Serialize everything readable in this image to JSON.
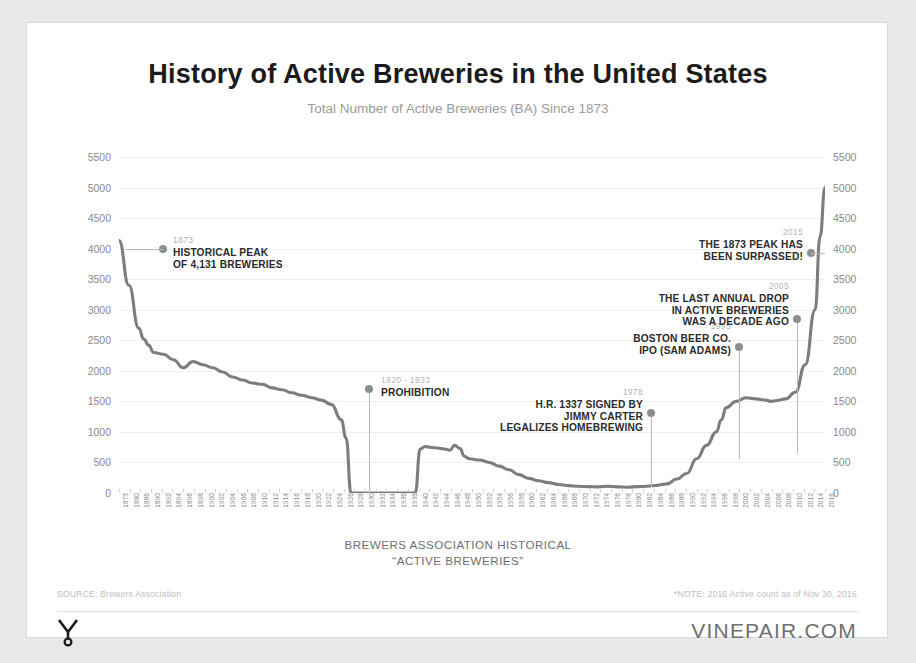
{
  "header": {
    "title": "History of Active Breweries in the United States",
    "subtitle": "Total Number of Active Breweries (BA) Since 1873"
  },
  "footer": {
    "axis_note_line1": "BREWERS ASSOCIATION HISTORICAL",
    "axis_note_line2": "“ACTIVE BREWERIES”",
    "source": "SOURCE: Brewers Association",
    "note": "*NOTE: 2016 Active count as of Nov 30, 2016",
    "logo_text": "VINEPAIR",
    "site": "VINEPAIR.COM"
  },
  "chart_data": {
    "type": "line",
    "title": "History of Active Breweries in the United States",
    "subtitle": "Total Number of Active Breweries (BA) Since 1873",
    "xlabel": "BREWERS ASSOCIATION HISTORICAL “ACTIVE BREWERIES”",
    "ylabel": "",
    "ylim": [
      0,
      5500
    ],
    "ytick_step": 500,
    "yticks": [
      0,
      500,
      1000,
      1500,
      2000,
      2500,
      3000,
      3500,
      4000,
      4500,
      5000,
      5500
    ],
    "ytick_labels": [
      "0",
      "500",
      "1000",
      "1500",
      "2000",
      "2500",
      "3000",
      "3500",
      "4000",
      "4500",
      "5000",
      "5500"
    ],
    "dual_y_axis": true,
    "grid": true,
    "legend": false,
    "line_color": "#7d7d7d",
    "xlim": [
      1873,
      2016
    ],
    "xtick_labels": [
      "1873",
      "1880",
      "1886",
      "1890",
      "1892",
      "1894",
      "1896",
      "1898",
      "1900",
      "1902",
      "1904",
      "1906",
      "1908",
      "1910",
      "1912",
      "1914",
      "1916",
      "1918",
      "1920",
      "1922",
      "1924",
      "1926",
      "1928",
      "1930",
      "1932",
      "1934",
      "1936",
      "1938",
      "1940",
      "1942",
      "1944",
      "1946",
      "1948",
      "1950",
      "1952",
      "1954",
      "1956",
      "1958",
      "1960",
      "1962",
      "1964",
      "1966",
      "1968",
      "1970",
      "1972",
      "1974",
      "1976",
      "1978",
      "1980",
      "1982",
      "1984",
      "1986",
      "1988",
      "1990",
      "1992",
      "1994",
      "1996",
      "1998",
      "2000",
      "2002",
      "2004",
      "2006",
      "2008",
      "2010",
      "2012",
      "2014",
      "2016"
    ],
    "series": [
      {
        "name": "Active Breweries",
        "x": [
          1873,
          1875,
          1877,
          1878,
          1879,
          1880,
          1882,
          1884,
          1886,
          1888,
          1890,
          1892,
          1894,
          1896,
          1898,
          1900,
          1902,
          1904,
          1906,
          1908,
          1910,
          1912,
          1914,
          1916,
          1918,
          1919,
          1920,
          1921,
          1933,
          1934,
          1935,
          1936,
          1937,
          1938,
          1939,
          1940,
          1941,
          1942,
          1943,
          1944,
          1946,
          1948,
          1950,
          1952,
          1954,
          1956,
          1958,
          1960,
          1962,
          1964,
          1966,
          1968,
          1970,
          1972,
          1974,
          1976,
          1978,
          1980,
          1982,
          1984,
          1986,
          1988,
          1990,
          1992,
          1994,
          1995,
          1996,
          1998,
          2000,
          2002,
          2004,
          2005,
          2006,
          2008,
          2010,
          2012,
          2014,
          2015,
          2016
        ],
        "values": [
          4131,
          3400,
          2700,
          2520,
          2420,
          2300,
          2270,
          2180,
          2050,
          2150,
          2100,
          2050,
          1980,
          1900,
          1850,
          1800,
          1780,
          1720,
          1690,
          1640,
          1600,
          1560,
          1520,
          1450,
          1200,
          900,
          0,
          0,
          0,
          720,
          760,
          750,
          740,
          730,
          720,
          700,
          780,
          730,
          600,
          560,
          540,
          500,
          440,
          380,
          300,
          240,
          200,
          170,
          140,
          120,
          110,
          105,
          100,
          110,
          100,
          95,
          105,
          110,
          125,
          150,
          230,
          320,
          560,
          780,
          1000,
          1200,
          1400,
          1500,
          1560,
          1540,
          1520,
          1500,
          1510,
          1540,
          1650,
          2100,
          3000,
          4200,
          5000
        ]
      }
    ],
    "annotations": [
      {
        "year": "1873",
        "lines": [
          "HISTORICAL PEAK",
          "OF 4,131 BREWERIES"
        ],
        "align": "left"
      },
      {
        "year": "1920 - 1933",
        "lines": [
          "PROHIBITION"
        ],
        "align": "left"
      },
      {
        "year": "1978",
        "lines": [
          "H.R. 1337 SIGNED BY",
          "JIMMY CARTER",
          "LEGALIZES HOMEBREWING"
        ],
        "align": "right"
      },
      {
        "year": "1995",
        "lines": [
          "BOSTON BEER CO.",
          "IPO (SAM ADAMS)"
        ],
        "align": "right"
      },
      {
        "year": "2005",
        "lines": [
          "THE LAST ANNUAL DROP",
          "IN ACTIVE BREWERIES",
          "WAS A DECADE AGO"
        ],
        "align": "right"
      },
      {
        "year": "2015",
        "lines": [
          "THE 1873 PEAK HAS",
          "BEEN SURPASSED!"
        ],
        "align": "right"
      }
    ]
  }
}
